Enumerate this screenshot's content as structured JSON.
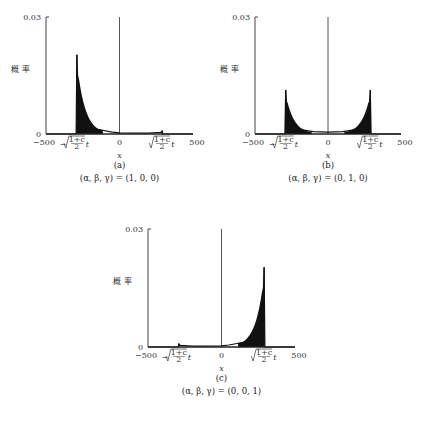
{
  "chart_data": [
    {
      "type": "line",
      "panel": "(a)",
      "caption": "(α, β, γ) = (1, 0, 0)",
      "xlabel": "x",
      "ylabel": "概率",
      "xlim": [
        -500,
        500
      ],
      "ylim": [
        0,
        0.03
      ],
      "x_ticks": [
        "−500",
        "−√((1+c)/2) t",
        "0",
        "√((1+c)/2) t",
        "500"
      ],
      "y_ticks": [
        "0",
        "0.03"
      ],
      "peaks": [
        {
          "x": -290,
          "y": 0.0203
        },
        {
          "x": 290,
          "y": 0.0008
        }
      ],
      "x": [
        -500,
        -295,
        -290,
        -280,
        -260,
        -220,
        -150,
        -50,
        0,
        100,
        200,
        280,
        290,
        295,
        500
      ],
      "values": [
        0,
        0,
        0.0203,
        0.009,
        0.005,
        0.0025,
        0.0012,
        0.0005,
        0.0003,
        0.0002,
        0.0002,
        0.0004,
        0.0008,
        0,
        0
      ]
    },
    {
      "type": "line",
      "panel": "(b)",
      "caption": "(α, β, γ) = (0, 1, 0)",
      "xlabel": "x",
      "ylabel": "概率",
      "xlim": [
        -500,
        500
      ],
      "ylim": [
        0,
        0.03
      ],
      "x_ticks": [
        "−500",
        "−√((1+c)/2) t",
        "0",
        "√((1+c)/2) t",
        "500"
      ],
      "y_ticks": [
        "0",
        "0.03"
      ],
      "peaks": [
        {
          "x": -290,
          "y": 0.0113
        },
        {
          "x": 290,
          "y": 0.0113
        }
      ],
      "x": [
        -500,
        -295,
        -290,
        -280,
        -250,
        -200,
        -100,
        0,
        100,
        200,
        250,
        280,
        290,
        295,
        500
      ],
      "values": [
        0,
        0,
        0.0113,
        0.005,
        0.0025,
        0.0012,
        0.0006,
        0.0005,
        0.0006,
        0.0012,
        0.0025,
        0.005,
        0.0113,
        0,
        0
      ]
    },
    {
      "type": "line",
      "panel": "(c)",
      "caption": "(α, β, γ) = (0, 0, 1)",
      "xlabel": "x",
      "ylabel": "概率",
      "xlim": [
        -500,
        500
      ],
      "ylim": [
        0,
        0.03
      ],
      "x_ticks": [
        "−500",
        "−√((1+c)/2) t",
        "0",
        "√((1+c)/2) t",
        "500"
      ],
      "y_ticks": [
        "0",
        "0.03"
      ],
      "peaks": [
        {
          "x": -290,
          "y": 0.0008
        },
        {
          "x": 290,
          "y": 0.0203
        }
      ],
      "x": [
        -500,
        -295,
        -290,
        -280,
        -200,
        -100,
        0,
        50,
        150,
        220,
        260,
        280,
        290,
        295,
        500
      ],
      "values": [
        0,
        0,
        0.0008,
        0.0004,
        0.0002,
        0.0002,
        0.0003,
        0.0005,
        0.0012,
        0.0025,
        0.005,
        0.009,
        0.0203,
        0,
        0
      ]
    }
  ],
  "panels": {
    "a": {
      "label": "(a)",
      "caption": "(α, β, γ) = (1, 0, 0)"
    },
    "b": {
      "label": "(b)",
      "caption": "(α, β, γ) = (0, 1, 0)"
    },
    "c": {
      "label": "(c)",
      "caption": "(α, β, γ) = (0, 0, 1)"
    }
  },
  "axis": {
    "y_top": "0.03",
    "y_bottom": "0",
    "x_min": "−500",
    "x_zero": "0",
    "x_max": "500",
    "x_label": "x",
    "y_label_1": "概",
    "y_label_2": "率",
    "neg_mark": "−√",
    "pos_mark": "√",
    "frac_num": "1+c",
    "frac_den": "2",
    "t": "t"
  }
}
